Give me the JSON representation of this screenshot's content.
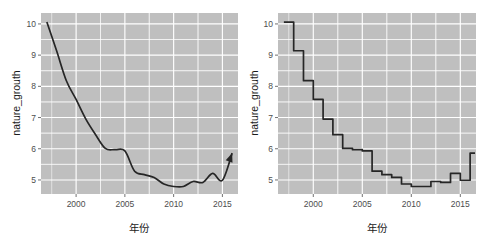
{
  "figure": {
    "panel_count": 2,
    "background": "#ffffff",
    "panel_background": "#bfbfbf",
    "grid_color": "#ffffff",
    "line_color": "#262626"
  },
  "chart_data": [
    {
      "type": "line",
      "title": "",
      "xlabel": "年份",
      "ylabel": "nature_grouth",
      "xlim": [
        1996.4,
        2016.6
      ],
      "ylim": [
        4.55,
        10.35
      ],
      "xticks": [
        2000,
        2005,
        2010,
        2015
      ],
      "xticklabels": [
        "2000",
        "2005",
        "2010",
        "2015"
      ],
      "yticks": [
        5,
        6,
        7,
        8,
        9,
        10
      ],
      "yticklabels": [
        "5",
        "6",
        "7",
        "8",
        "9",
        "10"
      ],
      "grid": true,
      "legend": "none",
      "annotation": "arrow-at-end",
      "x": [
        1997,
        1998,
        1999,
        2000,
        2001,
        2002,
        2003,
        2004,
        2005,
        2006,
        2007,
        2008,
        2009,
        2010,
        2011,
        2012,
        2013,
        2014,
        2015,
        2016
      ],
      "values": [
        10.06,
        9.14,
        8.18,
        7.58,
        6.95,
        6.45,
        6.01,
        5.97,
        5.93,
        5.28,
        5.17,
        5.08,
        4.87,
        4.79,
        4.79,
        4.95,
        4.92,
        5.21,
        4.99,
        5.86
      ]
    },
    {
      "type": "line",
      "subtype": "step",
      "title": "",
      "xlabel": "年份",
      "ylabel": "nature_grouth",
      "xlim": [
        1996.4,
        2016.6
      ],
      "ylim": [
        4.55,
        10.35
      ],
      "xticks": [
        2000,
        2005,
        2010,
        2015
      ],
      "xticklabels": [
        "2000",
        "2005",
        "2010",
        "2015"
      ],
      "yticks": [
        5,
        6,
        7,
        8,
        9,
        10
      ],
      "yticklabels": [
        "5",
        "6",
        "7",
        "8",
        "9",
        "10"
      ],
      "grid": true,
      "legend": "none",
      "annotation": "none",
      "x": [
        1997,
        1998,
        1999,
        2000,
        2001,
        2002,
        2003,
        2004,
        2005,
        2006,
        2007,
        2008,
        2009,
        2010,
        2011,
        2012,
        2013,
        2014,
        2015,
        2016
      ],
      "values": [
        10.06,
        9.14,
        8.18,
        7.58,
        6.95,
        6.45,
        6.01,
        5.97,
        5.93,
        5.28,
        5.17,
        5.08,
        4.87,
        4.79,
        4.79,
        4.95,
        4.92,
        5.21,
        4.99,
        5.86
      ]
    }
  ]
}
